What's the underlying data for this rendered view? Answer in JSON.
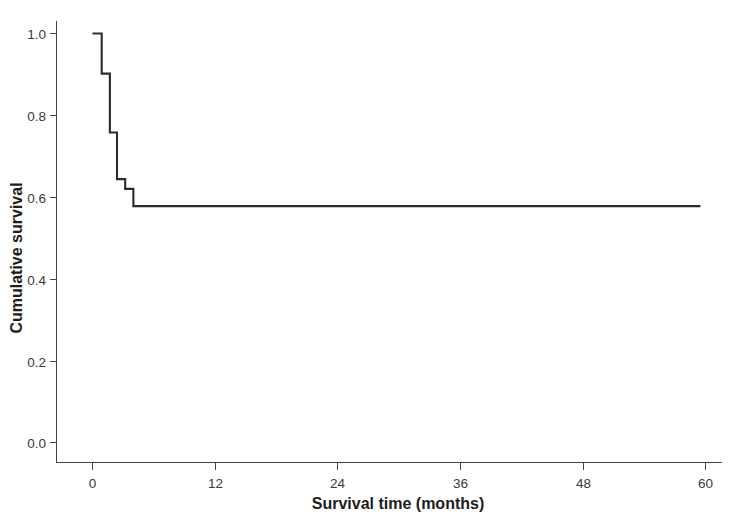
{
  "chart_data": {
    "type": "line",
    "subtype": "kaplan-meier-step",
    "title": "",
    "xlabel": "Survival time (months)",
    "ylabel": "Cumulative survival",
    "xlim": [
      -1.5,
      61.5
    ],
    "ylim": [
      -0.02,
      1.06
    ],
    "xticks": [
      0,
      12,
      24,
      36,
      48,
      60
    ],
    "xticklabels": [
      "0",
      "12",
      "24",
      "36",
      "48",
      "60"
    ],
    "yticks": [
      0.0,
      0.2,
      0.4,
      0.6,
      0.8,
      1.0
    ],
    "yticklabels": [
      "0.0",
      "0.2",
      "0.4",
      "0.6",
      "0.8",
      "1.0"
    ],
    "grid": false,
    "legend": null,
    "series": [
      {
        "name": "Cumulative survival",
        "color": "#2b2b2b",
        "step": "post",
        "x": [
          0.0,
          0.9,
          0.9,
          1.7,
          1.7,
          2.4,
          2.4,
          3.2,
          3.2,
          4.0,
          4.0,
          4.7,
          4.7,
          59.5
        ],
        "y": [
          1.0,
          1.0,
          0.902,
          0.902,
          0.758,
          0.758,
          0.644,
          0.644,
          0.62,
          0.62,
          0.578,
          0.578,
          0.578,
          0.578
        ],
        "steps": [
          {
            "time": 0.0,
            "survival": 1.0
          },
          {
            "time": 0.9,
            "survival": 0.902
          },
          {
            "time": 1.7,
            "survival": 0.758
          },
          {
            "time": 2.4,
            "survival": 0.644
          },
          {
            "time": 3.2,
            "survival": 0.62
          },
          {
            "time": 4.0,
            "survival": 0.578
          },
          {
            "time": 59.5,
            "survival": 0.578
          }
        ]
      }
    ]
  },
  "figure": {
    "x_axis_title": "Survival time (months)",
    "y_axis_title": "Cumulative survival"
  }
}
